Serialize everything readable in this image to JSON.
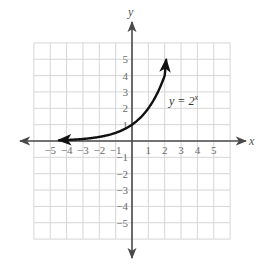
{
  "chart_data": {
    "type": "line",
    "title": "",
    "xlabel": "x",
    "ylabel": "y",
    "xlim": [
      -6,
      6
    ],
    "ylim": [
      -6,
      6
    ],
    "grid": true,
    "x_ticks": [
      -5,
      -4,
      -3,
      -2,
      -1,
      1,
      2,
      3,
      4,
      5
    ],
    "y_ticks": [
      -5,
      -4,
      -3,
      -2,
      -1,
      1,
      2,
      3,
      4,
      5
    ],
    "x_tick_labels": [
      "−5",
      "−4",
      "−3",
      "−2",
      "−1",
      "1",
      "2",
      "3",
      "4",
      "5"
    ],
    "y_tick_labels": [
      "−5",
      "−4",
      "−3",
      "−2",
      "−1",
      "1",
      "2",
      "3",
      "4",
      "5"
    ],
    "series": [
      {
        "name": "y = 2^x",
        "function": "2^x",
        "x": [
          -4.5,
          -4,
          -3,
          -2,
          -1,
          0,
          1,
          2,
          2.1
        ],
        "y": [
          0.044,
          0.0625,
          0.125,
          0.25,
          0.5,
          1,
          2,
          4,
          5
        ],
        "arrows_both_ends": true
      }
    ],
    "annotations": [
      {
        "text": "y = 2",
        "superscript": "x",
        "x": 2.2,
        "y": 2.2
      }
    ]
  },
  "labels": {
    "x_axis": "x",
    "y_axis": "y",
    "equation_base": "y = 2",
    "equation_sup": "x"
  },
  "colors": {
    "grid": "#d6d6d6",
    "axis": "#4a4a4a",
    "curve": "#111111",
    "tick_text": "#6b6b6b"
  }
}
